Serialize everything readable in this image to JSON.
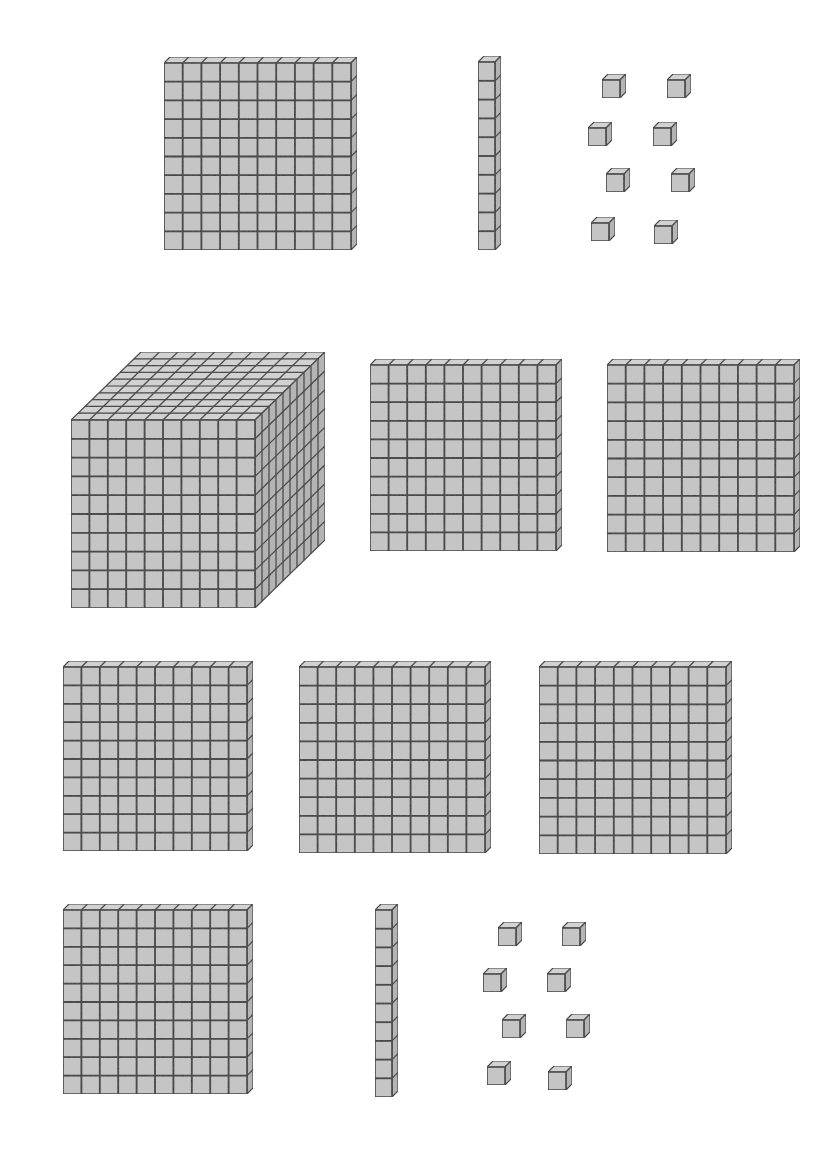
{
  "colors": {
    "fill_front": "#c6c6c6",
    "fill_top": "#d4d4d4",
    "fill_side": "#b4b4b4",
    "line": "#333333",
    "background": "#ffffff"
  },
  "groups": [
    {
      "name": "top-group",
      "value": "128",
      "blocks": [
        {
          "type": "flat",
          "x": 164,
          "y": 63,
          "size": 187,
          "depth": 6
        },
        {
          "type": "rod",
          "x": 478,
          "y": 62,
          "w": 17,
          "h": 188,
          "depth": 6
        },
        {
          "type": "unit",
          "x": 602,
          "y": 74
        },
        {
          "type": "unit",
          "x": 667,
          "y": 74
        },
        {
          "type": "unit",
          "x": 588,
          "y": 122
        },
        {
          "type": "unit",
          "x": 653,
          "y": 122
        },
        {
          "type": "unit",
          "x": 606,
          "y": 168
        },
        {
          "type": "unit",
          "x": 671,
          "y": 168
        },
        {
          "type": "unit",
          "x": 591,
          "y": 217
        },
        {
          "type": "unit",
          "x": 654,
          "y": 220
        }
      ]
    },
    {
      "name": "bottom-group",
      "value": "1618",
      "blocks": [
        {
          "type": "cube",
          "x": 71,
          "y": 420,
          "size": 184,
          "dx": 70,
          "dy": -68
        },
        {
          "type": "flat",
          "x": 370,
          "y": 365,
          "size": 186,
          "depth": 6
        },
        {
          "type": "flat",
          "x": 607,
          "y": 365,
          "size": 187,
          "depth": 6
        },
        {
          "type": "flat",
          "x": 63,
          "y": 667,
          "size": 184,
          "depth": 6
        },
        {
          "type": "flat",
          "x": 299,
          "y": 667,
          "size": 186,
          "depth": 6
        },
        {
          "type": "flat",
          "x": 539,
          "y": 667,
          "size": 187,
          "depth": 6
        },
        {
          "type": "flat",
          "x": 63,
          "y": 910,
          "size": 184,
          "depth": 6
        },
        {
          "type": "rod",
          "x": 375,
          "y": 910,
          "w": 17,
          "h": 187,
          "depth": 6
        },
        {
          "type": "unit",
          "x": 498,
          "y": 922
        },
        {
          "type": "unit",
          "x": 562,
          "y": 922
        },
        {
          "type": "unit",
          "x": 483,
          "y": 968
        },
        {
          "type": "unit",
          "x": 547,
          "y": 968
        },
        {
          "type": "unit",
          "x": 502,
          "y": 1014
        },
        {
          "type": "unit",
          "x": 566,
          "y": 1014
        },
        {
          "type": "unit",
          "x": 487,
          "y": 1061
        },
        {
          "type": "unit",
          "x": 548,
          "y": 1066
        }
      ]
    }
  ],
  "legend": {
    "cube": "1000",
    "flat": "100",
    "rod": "10",
    "unit": "1"
  }
}
